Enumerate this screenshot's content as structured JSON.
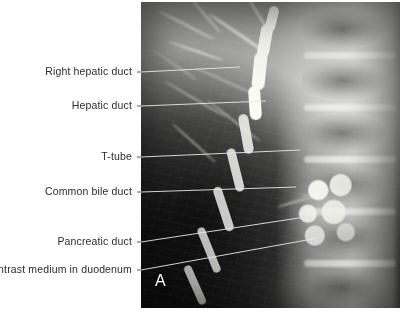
{
  "figure": {
    "panel_letter": "A",
    "modality": "T-tube cholangiogram radiograph",
    "background_color": "#ffffff",
    "label_color": "#2b2b2b",
    "leader_line_color_outside": "#4a4a4a",
    "leader_line_color_inside": "#e8e8e8",
    "image_box": {
      "x": 141,
      "y": 2,
      "width": 259,
      "height": 306
    }
  },
  "annotations": [
    {
      "id": "right-hepatic-duct",
      "label": "Right hepatic duct",
      "text_anchor_x": 138,
      "text_baseline_y": 76,
      "leader": {
        "x1": 141,
        "y1": 72,
        "x2": 240,
        "y2": 67
      }
    },
    {
      "id": "hepatic-duct",
      "label": "Hepatic duct",
      "text_anchor_x": 138,
      "text_baseline_y": 110,
      "leader": {
        "x1": 141,
        "y1": 106,
        "x2": 266,
        "y2": 101
      }
    },
    {
      "id": "t-tube",
      "label": "T-tube",
      "text_anchor_x": 138,
      "text_baseline_y": 161,
      "leader": {
        "x1": 141,
        "y1": 157,
        "x2": 300,
        "y2": 150
      }
    },
    {
      "id": "common-bile-duct",
      "label": "Common bile duct",
      "text_anchor_x": 138,
      "text_baseline_y": 196,
      "leader": {
        "x1": 141,
        "y1": 192,
        "x2": 296,
        "y2": 187
      }
    },
    {
      "id": "pancreatic-duct",
      "label": "Pancreatic duct",
      "text_anchor_x": 138,
      "text_baseline_y": 246,
      "leader": {
        "x1": 141,
        "y1": 242,
        "x2": 312,
        "y2": 216
      }
    },
    {
      "id": "contrast-medium-in-duodenum",
      "label": "Contrast medium in duodenum",
      "text_anchor_x": 138,
      "text_baseline_y": 274,
      "leader": {
        "x1": 141,
        "y1": 270,
        "x2": 318,
        "y2": 238
      }
    }
  ]
}
